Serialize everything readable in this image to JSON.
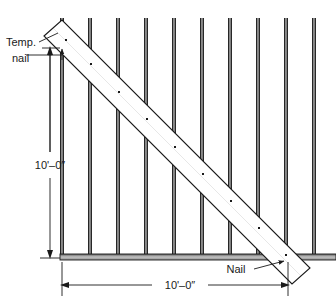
{
  "figure": {
    "background_color": "#ffffff",
    "line_color": "#1a1a1a",
    "stud_fill_color": "#8c8c8c",
    "plate_fill_color": "#b3b3b3",
    "brace_fill_color": "#ffffff"
  },
  "callouts": {
    "temp_nail_line1": "Temp.",
    "temp_nail_line2": "nail",
    "nail": "Nail"
  },
  "dimensions": {
    "vertical": "10'–0″",
    "horizontal": "10'–0″"
  },
  "geometry": {
    "studs": [
      {
        "name": "stud-1",
        "x": 62
      },
      {
        "name": "stud-2",
        "x": 90
      },
      {
        "name": "stud-3",
        "x": 118
      },
      {
        "name": "stud-4",
        "x": 146
      },
      {
        "name": "stud-5",
        "x": 174
      },
      {
        "name": "stud-6",
        "x": 202
      },
      {
        "name": "stud-7",
        "x": 230
      },
      {
        "name": "stud-8",
        "x": 258
      },
      {
        "name": "stud-9",
        "x": 286
      },
      {
        "name": "stud-10",
        "x": 314
      }
    ],
    "stud_top_y": 18,
    "stud_bottom_y": 255,
    "stud_width": 4,
    "plate": {
      "x": 60,
      "y": 254,
      "width": 276,
      "height": 6
    },
    "brace": {
      "start_x": 56,
      "start_y": 30,
      "end_x": 298,
      "end_y": 268,
      "width": 18
    },
    "nail_dots": [
      {
        "x": 66,
        "y": 40
      },
      {
        "x": 91,
        "y": 64
      },
      {
        "x": 119,
        "y": 92
      },
      {
        "x": 147,
        "y": 119
      },
      {
        "x": 175,
        "y": 147
      },
      {
        "x": 203,
        "y": 174
      },
      {
        "x": 231,
        "y": 201
      },
      {
        "x": 259,
        "y": 228
      },
      {
        "x": 286,
        "y": 255
      }
    ],
    "vertical_dim_line_x": 50,
    "vertical_dim_top_y": 48,
    "vertical_dim_bottom_y": 257,
    "horizontal_dim_line_y": 285,
    "horizontal_dim_left_x": 62,
    "horizontal_dim_right_x": 288
  }
}
